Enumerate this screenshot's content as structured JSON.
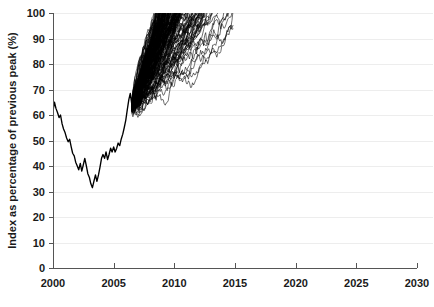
{
  "chart_data": {
    "type": "line",
    "title": "",
    "subtitle": "",
    "xlabel": "",
    "ylabel": "Index as percentage of previous peak (%)",
    "xlim": [
      2000,
      2030
    ],
    "ylim": [
      0,
      100
    ],
    "grid": true,
    "grid_axis": "y",
    "legend": false,
    "legend_position": "none",
    "xticks": [
      2000,
      2005,
      2010,
      2015,
      2020,
      2025,
      2030
    ],
    "xticklabels": [
      "2000",
      "2005",
      "2010",
      "2015",
      "2020",
      "2025",
      "2030"
    ],
    "yticks": [
      0,
      10,
      20,
      30,
      40,
      50,
      60,
      70,
      80,
      90,
      100
    ],
    "yticklabels": [
      "0",
      "10",
      "20",
      "30",
      "40",
      "50",
      "60",
      "70",
      "80",
      "90",
      "100"
    ],
    "colors": {
      "history_line": "#000000",
      "simulation_line": "#000000",
      "gridline": "#ededed",
      "axis": "#555555",
      "text": "#1a1a1a",
      "background": "#ffffff"
    },
    "series": [
      {
        "name": "Historical index",
        "type": "line",
        "x": [
          2000.0,
          2000.12,
          2000.25,
          2000.37,
          2000.5,
          2000.62,
          2000.75,
          2000.87,
          2001.0,
          2001.12,
          2001.25,
          2001.37,
          2001.5,
          2001.62,
          2001.75,
          2001.87,
          2002.0,
          2002.12,
          2002.25,
          2002.37,
          2002.5,
          2002.62,
          2002.75,
          2002.87,
          2003.0,
          2003.12,
          2003.25,
          2003.37,
          2003.5,
          2003.62,
          2003.75,
          2003.87,
          2004.0,
          2004.12,
          2004.25,
          2004.37,
          2004.5,
          2004.62,
          2004.75,
          2004.87,
          2005.0,
          2005.12,
          2005.25,
          2005.37,
          2005.5,
          2005.62,
          2005.75,
          2005.87,
          2006.0,
          2006.12,
          2006.25,
          2006.37,
          2006.5
        ],
        "y": [
          61.5,
          65.0,
          62.5,
          61.0,
          59.0,
          60.0,
          56.5,
          54.5,
          53.0,
          51.0,
          49.5,
          50.5,
          47.5,
          45.0,
          44.0,
          41.5,
          40.0,
          38.5,
          41.0,
          38.0,
          40.5,
          43.0,
          40.0,
          37.0,
          35.5,
          33.0,
          31.5,
          34.0,
          36.5,
          34.0,
          36.5,
          39.5,
          43.0,
          44.5,
          43.0,
          45.5,
          42.5,
          44.5,
          47.0,
          45.5,
          47.5,
          45.5,
          47.0,
          49.0,
          48.0,
          50.5,
          52.5,
          55.0,
          58.0,
          62.0,
          66.0,
          68.5,
          64.0
        ]
      }
    ],
    "simulation_fan": {
      "name": "Monte Carlo forecast paths",
      "description": "Dense bundle of stochastic simulation paths fanning upward from the 2006 historical endpoint toward the 100% previous-peak ceiling",
      "n_paths": 180,
      "start_year": 2006.5,
      "start_value": 64.0,
      "end_year_min": 2010.0,
      "end_year_max": 2014.8,
      "ceiling": 100,
      "median_end_year": 2011.5,
      "drift_per_year_min": 5.5,
      "drift_per_year_max": 16.0,
      "volatility": 3.4
    }
  },
  "figure": {
    "width": 434,
    "height": 307
  }
}
